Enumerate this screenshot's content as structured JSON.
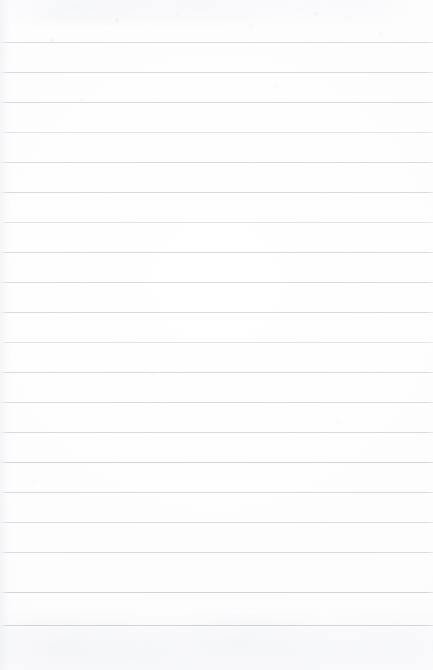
{
  "document": {
    "kind": "scanned-ruled-paper",
    "title": "Blank lined notebook page",
    "page_width": 433,
    "page_height": 670,
    "text_content": "",
    "handwriting_present": false,
    "printed_text_present": false
  },
  "paper": {
    "background_color": "#fdfdfe",
    "highlight_color": "#ffffff",
    "texture": "faint scanner mottling / paper grain",
    "top_margin_px": 42,
    "bottom_margin_px": 45,
    "left_margin_px": 0,
    "right_margin_px": 0
  },
  "ruling": {
    "style": "wide-ruled horizontal lines, full bleed, no vertical margin rule",
    "line_color": "#d9dbdf",
    "line_color_light": "#e2e4e8",
    "line_color_dark": "#d2d4d9",
    "line_thickness_px": 1,
    "line_spacing_px": 30,
    "first_line_y": 42,
    "last_line_y": 625,
    "line_count": 20,
    "lines": [
      {
        "index": 1,
        "y": 42,
        "weight": "normal"
      },
      {
        "index": 2,
        "y": 72,
        "weight": "normal"
      },
      {
        "index": 3,
        "y": 102,
        "weight": "normal"
      },
      {
        "index": 4,
        "y": 132,
        "weight": "light"
      },
      {
        "index": 5,
        "y": 162,
        "weight": "normal"
      },
      {
        "index": 6,
        "y": 192,
        "weight": "normal"
      },
      {
        "index": 7,
        "y": 222,
        "weight": "light"
      },
      {
        "index": 8,
        "y": 252,
        "weight": "normal"
      },
      {
        "index": 9,
        "y": 282,
        "weight": "normal"
      },
      {
        "index": 10,
        "y": 312,
        "weight": "normal"
      },
      {
        "index": 11,
        "y": 342,
        "weight": "light"
      },
      {
        "index": 12,
        "y": 372,
        "weight": "normal"
      },
      {
        "index": 13,
        "y": 402,
        "weight": "normal"
      },
      {
        "index": 14,
        "y": 432,
        "weight": "normal"
      },
      {
        "index": 15,
        "y": 462,
        "weight": "dark"
      },
      {
        "index": 16,
        "y": 492,
        "weight": "normal"
      },
      {
        "index": 17,
        "y": 522,
        "weight": "normal"
      },
      {
        "index": 18,
        "y": 552,
        "weight": "normal"
      },
      {
        "index": 19,
        "y": 592,
        "weight": "dark"
      },
      {
        "index": 20,
        "y": 625,
        "weight": "dark"
      }
    ]
  }
}
